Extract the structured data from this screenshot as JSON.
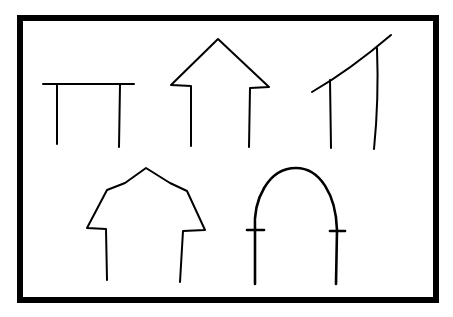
{
  "figure": {
    "background": "#ffffff",
    "stroke_color": "#000000",
    "frame": {
      "x": 20,
      "y": 18,
      "width": 416,
      "height": 282
    },
    "shapes": [
      {
        "id": "flat-roof",
        "label": "Flat roof",
        "paths": [
          "M43 84 L134 84",
          "M57 85 L57 144",
          "M120 85 L119 147"
        ]
      },
      {
        "id": "gable-roof",
        "label": "Gable roof",
        "paths": [
          "M191 146 L191 86 L171 85 L218 39 L269 87 L250 88 L249 147"
        ]
      },
      {
        "id": "shed-roof",
        "label": "Shed roof",
        "paths": [
          "M312 92 Q350 70 391 35",
          "M330 80 L331 148",
          "M377 48 Q379 100 374 149"
        ]
      },
      {
        "id": "gambrel-roof",
        "label": "Gambrel roof",
        "paths": [
          "M107 280 L106 229 L87 228 L107 190 L125 183 L146 168 L170 183 L187 191 L205 230 L183 231 L180 282"
        ]
      },
      {
        "id": "arch-roof",
        "label": "Arched roof",
        "paths": [
          "M255 284 L255 230 C253 200 268 168 296 168 C320 168 336 195 337 230 L336 284"
        ],
        "ticks": [
          "M247 230 L264 230",
          "M330 231 L345 231"
        ]
      }
    ]
  }
}
